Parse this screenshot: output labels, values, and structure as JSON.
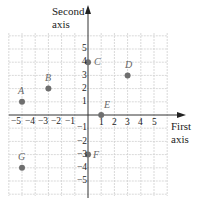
{
  "axes": {
    "x_label_line1": "First",
    "x_label_line2": "axis",
    "y_label_line1": "Second",
    "y_label_line2": "axis",
    "x_ticks": [
      "−5",
      "−4",
      "−3",
      "−2",
      "−1",
      "1",
      "2",
      "3",
      "4",
      "5"
    ],
    "y_ticks": [
      "5",
      "4",
      "3",
      "2",
      "1",
      "−1",
      "−2",
      "−3",
      "−4",
      "−5"
    ]
  },
  "points": [
    {
      "label": "A",
      "x": -5,
      "y": 1
    },
    {
      "label": "B",
      "x": -3,
      "y": 2
    },
    {
      "label": "C",
      "x": 0,
      "y": 4
    },
    {
      "label": "D",
      "x": 3,
      "y": 3
    },
    {
      "label": "E",
      "x": 1,
      "y": 0
    },
    {
      "label": "F",
      "x": 0,
      "y": -3
    },
    {
      "label": "G",
      "x": -5,
      "y": -4
    }
  ],
  "colors": {
    "grid": "#c8c8c8",
    "axis": "#333333",
    "point": "#6e6e6e"
  }
}
